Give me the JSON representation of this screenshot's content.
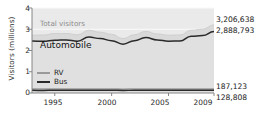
{
  "chart_data": {
    "type": "area",
    "title": "",
    "xlabel": "",
    "ylabel": "Visitors (millions)",
    "xlim": [
      1993,
      2009
    ],
    "ylim": [
      0,
      4
    ],
    "grid": true,
    "legend_position": "inside-left",
    "x": [
      1993,
      1994,
      1995,
      1996,
      1997,
      1998,
      1999,
      2000,
      2001,
      2002,
      2003,
      2004,
      2005,
      2006,
      2007,
      2008,
      2009
    ],
    "series": [
      {
        "name": "Total visitors",
        "color": "#d9d9d9",
        "values": [
          2.72,
          2.73,
          2.8,
          2.8,
          2.74,
          2.95,
          2.86,
          2.76,
          2.56,
          2.74,
          2.9,
          2.78,
          2.72,
          2.73,
          2.95,
          3.0,
          3.21
        ]
      },
      {
        "name": "Automobile",
        "color": "#2a2a2a",
        "values": [
          2.45,
          2.43,
          2.48,
          2.5,
          2.44,
          2.63,
          2.56,
          2.46,
          2.3,
          2.46,
          2.61,
          2.5,
          2.44,
          2.45,
          2.67,
          2.7,
          2.89
        ]
      },
      {
        "name": "RV",
        "color": "#9a9a9a",
        "values": [
          0.185,
          0.183,
          0.186,
          0.188,
          0.186,
          0.19,
          0.189,
          0.187,
          0.182,
          0.186,
          0.19,
          0.188,
          0.185,
          0.184,
          0.186,
          0.186,
          0.187
        ]
      },
      {
        "name": "Bus",
        "color": "#2a2a2a",
        "values": [
          0.124,
          0.123,
          0.125,
          0.126,
          0.125,
          0.128,
          0.127,
          0.126,
          0.122,
          0.125,
          0.128,
          0.127,
          0.125,
          0.124,
          0.126,
          0.127,
          0.129
        ]
      }
    ],
    "ytick_labels": [
      "4",
      "3",
      "2",
      "1",
      "0"
    ],
    "ytick_values": [
      4,
      3,
      2,
      1,
      0
    ],
    "xtick_labels": [
      "1995",
      "2000",
      "2005",
      "2009"
    ],
    "xtick_values": [
      1995,
      2000,
      2005,
      2009
    ],
    "annotations": {
      "total_visitors_label": "Total visitors",
      "automobile_label": "Automobile",
      "total_visitors_value": "3,206,638",
      "automobile_value": "2,888,793",
      "rv_value": "187,123",
      "bus_value": "128,808"
    },
    "legend_entries": [
      {
        "label": "RV",
        "color": "#9a9a9a"
      },
      {
        "label": "Bus",
        "color": "#2a2a2a"
      }
    ]
  },
  "colors": {
    "plot_background": "#eaeaea",
    "total_band": "#d9d9d9",
    "automobile_fill": "#e0e0e0",
    "line_dark": "#2a2a2a",
    "line_gray": "#9a9a9a",
    "gridline": "#fafafa",
    "axis": "#7a7a7a",
    "text": "#1a1a1a",
    "muted_text": "#8c8c8c"
  }
}
